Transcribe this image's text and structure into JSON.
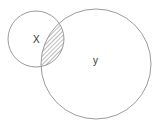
{
  "diagram": {
    "type": "venn",
    "sets": [
      {
        "id": "x",
        "label": "X",
        "cx": 36,
        "cy": 39,
        "r": 28
      },
      {
        "id": "y",
        "label": "y",
        "cx": 96,
        "cy": 64,
        "r": 55
      }
    ],
    "highlighted_region": "X ∩ Y",
    "style": {
      "stroke_color": "#9a9a9a",
      "hatch_color": "#555555",
      "background": "#ffffff"
    }
  }
}
